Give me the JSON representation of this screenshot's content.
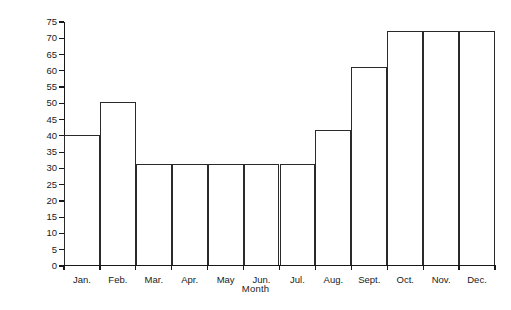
{
  "chart_data": {
    "type": "bar",
    "title": "",
    "xlabel": "Month",
    "ylabel": "Number",
    "categories": [
      "Jan.",
      "Feb.",
      "Mar.",
      "Apr.",
      "May",
      "Jun.",
      "Jul.",
      "Aug.",
      "Sept.",
      "Oct.",
      "Nov.",
      "Dec."
    ],
    "values": [
      40,
      50,
      31,
      31,
      31,
      31,
      31,
      41.5,
      61,
      72,
      72,
      72
    ],
    "series": [
      {
        "name": "Number",
        "values": [
          40,
          50,
          31,
          31,
          31,
          31,
          31,
          41.5,
          61,
          72,
          72,
          72
        ]
      }
    ],
    "ylim": [
      0,
      75
    ],
    "y_ticks": [
      0,
      5,
      10,
      15,
      20,
      25,
      30,
      35,
      40,
      45,
      50,
      55,
      60,
      65,
      70,
      75
    ],
    "y_tick_labels": [
      "0",
      "5",
      "10",
      "15",
      "20",
      "25",
      "30",
      "35",
      "40",
      "45",
      "50",
      "55",
      "60",
      "65",
      "70",
      "75"
    ],
    "grid": false,
    "legend": false,
    "legend_position": "none",
    "bar_style": "adjacent-outlined",
    "bar_fill_color": "#ffffff",
    "bar_edge_color": "#2a2a2a",
    "axis_color": "#181818"
  }
}
